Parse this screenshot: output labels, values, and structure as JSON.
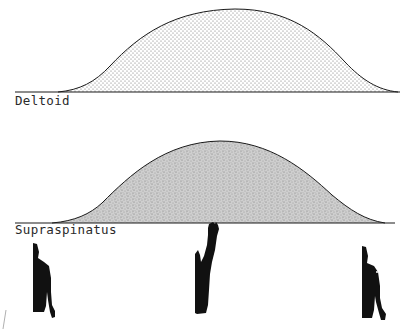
{
  "figure": {
    "panels": [
      {
        "label": "Deltoid",
        "fill_style": "dotted",
        "baseline_y": 92,
        "curve": {
          "start_x": 15,
          "rise_x": 60,
          "peak_x": 235,
          "peak_y": 9,
          "end_x": 395,
          "line_end_x": 400
        }
      },
      {
        "label": "Supraspinatus",
        "fill_style": "dense-stipple",
        "baseline_y": 223,
        "curve": {
          "start_x": 15,
          "rise_x": 55,
          "peak_x": 220,
          "peak_y": 141,
          "end_x": 385,
          "line_end_x": 395
        }
      }
    ],
    "arm_positions": [
      {
        "name": "arm-at-side-start",
        "description": "arm at side"
      },
      {
        "name": "arm-fully-raised",
        "description": "arm raised overhead"
      },
      {
        "name": "arm-at-side-end",
        "description": "arm returned to side"
      }
    ],
    "colors": {
      "ink": "#1a1a1a",
      "background": "#ffffff",
      "stipple_light": "#9a9a9a",
      "stipple_dense": "#b8b8b8"
    }
  }
}
